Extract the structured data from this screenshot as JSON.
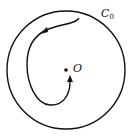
{
  "diagram": {
    "boundary_label": "C",
    "boundary_subscript": "0",
    "center_label": "O",
    "colors": {
      "stroke": "#111111",
      "background": "#ffffff"
    }
  }
}
